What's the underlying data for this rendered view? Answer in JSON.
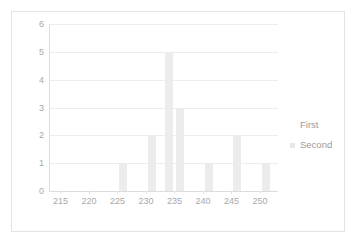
{
  "chart_data": {
    "type": "bar",
    "title": "",
    "subtitle": "",
    "xlabel": "",
    "ylabel": "",
    "xlim": [
      213,
      253
    ],
    "ylim": [
      0,
      6
    ],
    "y_ticks": [
      6,
      5,
      4,
      3,
      2,
      1,
      0
    ],
    "x_ticks": [
      215,
      220,
      225,
      230,
      235,
      240,
      245,
      250
    ],
    "grid": true,
    "legend_position": "right",
    "legend": [
      "First",
      "Second"
    ],
    "series": [
      {
        "name": "First",
        "x": [],
        "values": []
      },
      {
        "name": "Second",
        "x": [
          226,
          231,
          234,
          236,
          241,
          246,
          251
        ],
        "values": [
          1,
          2,
          5,
          3,
          1,
          2,
          1
        ]
      }
    ],
    "bars": [
      {
        "x": 226,
        "value": 1
      },
      {
        "x": 231,
        "value": 2
      },
      {
        "x": 234,
        "value": 5
      },
      {
        "x": 236,
        "value": 3
      },
      {
        "x": 241,
        "value": 1
      },
      {
        "x": 246,
        "value": 2
      },
      {
        "x": 251,
        "value": 1
      }
    ],
    "colors": {
      "bar": "#ececec",
      "grid": "#ededed",
      "axis": "#dcdcdc",
      "tick_label": "#a8a8a8",
      "legend_text": "#9a9a9a",
      "card_border": "#e3e3e3",
      "background": "#ffffff"
    }
  },
  "legend": {
    "items": [
      {
        "label": "First",
        "swatch": "legend-swatch-first"
      },
      {
        "label": "Second",
        "swatch": "legend-swatch-second"
      }
    ]
  },
  "axes": {
    "y": {
      "labels": [
        "6",
        "5",
        "4",
        "3",
        "2",
        "1",
        "0"
      ]
    },
    "x": {
      "labels": [
        "215",
        "220",
        "225",
        "230",
        "235",
        "240",
        "245",
        "250"
      ]
    }
  }
}
